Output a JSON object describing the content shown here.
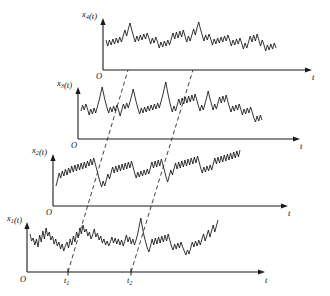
{
  "figure": {
    "background_color": "#ffffff",
    "line_color": "#111111",
    "dash_color": "#2b2b2b",
    "width": 330,
    "height": 296
  },
  "panels": [
    {
      "id": "panel-x4",
      "y_label_base": "x",
      "y_label_sub": "4",
      "y_label_arg": "(t)",
      "origin_label": "O",
      "t_label": "t",
      "origin": {
        "x": 103,
        "y": 70
      },
      "y_axis_top": 18,
      "t_axis_end": 312,
      "label_pos": {
        "x": 82,
        "y": 17
      },
      "origin_label_pos": {
        "x": 96,
        "y": 79
      },
      "t_label_pos": {
        "x": 312,
        "y": 80
      }
    },
    {
      "id": "panel-x3",
      "y_label_base": "x",
      "y_label_sub": "3",
      "y_label_arg": "(t)",
      "origin_label": "O",
      "t_label": "t",
      "origin": {
        "x": 78,
        "y": 139
      },
      "y_axis_top": 87,
      "t_axis_end": 300,
      "label_pos": {
        "x": 57,
        "y": 86
      },
      "origin_label_pos": {
        "x": 71,
        "y": 148
      },
      "t_label_pos": {
        "x": 300,
        "y": 149
      }
    },
    {
      "id": "panel-x2",
      "y_label_base": "x",
      "y_label_sub": "2",
      "y_label_arg": "(t)",
      "origin_label": "O",
      "t_label": "t",
      "origin": {
        "x": 53,
        "y": 206
      },
      "y_axis_top": 154,
      "t_axis_end": 288,
      "label_pos": {
        "x": 32,
        "y": 153
      },
      "origin_label_pos": {
        "x": 46,
        "y": 215
      },
      "t_label_pos": {
        "x": 288,
        "y": 216
      }
    },
    {
      "id": "panel-x1",
      "y_label_base": "x",
      "y_label_sub": "1",
      "y_label_arg": "(t)",
      "origin_label": "O",
      "t_label": "t",
      "origin": {
        "x": 27,
        "y": 272
      },
      "y_axis_top": 222,
      "t_axis_end": 265,
      "label_pos": {
        "x": 7,
        "y": 221
      },
      "origin_label_pos": {
        "x": 20,
        "y": 282
      },
      "t_label_pos": {
        "x": 265,
        "y": 283
      }
    }
  ],
  "time_markers": [
    {
      "id": "marker-t1",
      "label_base": "t",
      "label_sub": "1",
      "x_bottom": 68,
      "x_top": 128,
      "label_pos": {
        "x": 64,
        "y": 283
      }
    },
    {
      "id": "marker-t2",
      "label_base": "t",
      "label_sub": "2",
      "x_bottom": 131,
      "x_top": 193,
      "label_pos": {
        "x": 127,
        "y": 283
      }
    }
  ],
  "chart_data": {
    "type": "line",
    "xlabel": "t",
    "ylabel": "x_i(t)",
    "grid": false,
    "legend": null,
    "annotations": [
      "t1",
      "t2",
      "O"
    ],
    "series": [
      {
        "name": "x1(t)",
        "baseline_y": 272,
        "x_start": 30,
        "x_end": 218,
        "values": [
          38,
          31,
          34,
          27,
          33,
          25,
          37,
          30,
          41,
          33,
          44,
          36,
          40,
          32,
          36,
          28,
          33,
          26,
          30,
          23,
          28,
          21,
          26,
          30,
          24,
          33,
          27,
          36,
          30,
          40,
          34,
          44,
          38,
          47,
          40,
          43,
          36,
          40,
          33,
          37,
          43,
          35,
          39,
          32,
          36,
          29,
          33,
          27,
          31,
          26,
          30,
          35,
          29,
          34,
          28,
          33,
          27,
          32,
          26,
          31,
          37,
          30,
          35,
          28,
          33,
          27,
          32,
          38,
          46,
          54,
          44,
          36,
          30,
          24,
          20,
          26,
          33,
          27,
          34,
          28,
          35,
          29,
          36,
          30,
          37,
          31,
          38,
          32,
          26,
          22,
          28,
          23,
          29,
          24,
          30,
          25,
          21,
          17,
          22,
          18,
          24,
          30,
          25,
          31,
          26,
          32,
          27,
          33,
          38,
          31,
          36,
          42,
          35,
          41,
          47,
          40,
          46,
          52
        ]
      },
      {
        "name": "x2(t)",
        "baseline_y": 206,
        "x_start": 56,
        "x_end": 240,
        "values": [
          20,
          26,
          33,
          28,
          35,
          30,
          37,
          31,
          38,
          33,
          40,
          34,
          41,
          35,
          42,
          36,
          43,
          37,
          44,
          38,
          45,
          40,
          47,
          41,
          48,
          42,
          36,
          30,
          24,
          19,
          25,
          20,
          26,
          32,
          27,
          33,
          39,
          33,
          40,
          34,
          41,
          35,
          42,
          36,
          43,
          37,
          44,
          38,
          45,
          39,
          33,
          28,
          34,
          29,
          35,
          30,
          36,
          31,
          37,
          32,
          38,
          44,
          38,
          45,
          39,
          46,
          40,
          47,
          41,
          35,
          29,
          24,
          30,
          36,
          31,
          37,
          43,
          37,
          44,
          38,
          45,
          39,
          46,
          40,
          47,
          41,
          48,
          42,
          49,
          43,
          50,
          44,
          38,
          33,
          39,
          34,
          40,
          35,
          41,
          36,
          42,
          48,
          42,
          49,
          43,
          50,
          44,
          51,
          45,
          52,
          46,
          53,
          47,
          54,
          48,
          55,
          49,
          56
        ]
      },
      {
        "name": "x3(t)",
        "baseline_y": 139,
        "x_start": 81,
        "x_end": 262,
        "values": [
          28,
          34,
          29,
          35,
          30,
          24,
          30,
          25,
          31,
          26,
          32,
          38,
          45,
          52,
          44,
          37,
          31,
          26,
          32,
          27,
          33,
          28,
          34,
          29,
          23,
          29,
          35,
          30,
          36,
          31,
          37,
          43,
          50,
          43,
          36,
          30,
          25,
          31,
          26,
          32,
          27,
          33,
          28,
          34,
          29,
          35,
          30,
          36,
          31,
          37,
          43,
          50,
          57,
          48,
          40,
          33,
          27,
          33,
          28,
          34,
          40,
          34,
          41,
          35,
          42,
          36,
          43,
          37,
          44,
          38,
          45,
          39,
          33,
          28,
          34,
          29,
          35,
          41,
          48,
          41,
          35,
          29,
          35,
          30,
          36,
          42,
          36,
          43,
          37,
          44,
          38,
          32,
          27,
          33,
          28,
          34,
          29,
          35,
          30,
          24,
          30,
          25,
          31,
          26,
          32,
          27,
          21,
          17,
          23,
          18,
          24,
          19
        ]
      },
      {
        "name": "x4(t)",
        "baseline_y": 70,
        "x_start": 106,
        "x_end": 276,
        "values": [
          30,
          24,
          30,
          25,
          31,
          26,
          32,
          27,
          33,
          28,
          34,
          40,
          34,
          41,
          47,
          40,
          34,
          28,
          34,
          29,
          35,
          30,
          36,
          31,
          37,
          32,
          26,
          32,
          27,
          33,
          28,
          22,
          28,
          23,
          29,
          24,
          30,
          25,
          31,
          37,
          31,
          38,
          32,
          39,
          33,
          40,
          34,
          28,
          34,
          29,
          35,
          41,
          35,
          42,
          48,
          41,
          35,
          29,
          35,
          30,
          36,
          31,
          25,
          31,
          26,
          32,
          27,
          33,
          28,
          34,
          29,
          35,
          30,
          24,
          30,
          25,
          31,
          26,
          32,
          27,
          21,
          27,
          22,
          28,
          34,
          28,
          35,
          29,
          36,
          30,
          24,
          30,
          25,
          19,
          25,
          20,
          26,
          21,
          27,
          22
        ]
      }
    ]
  }
}
